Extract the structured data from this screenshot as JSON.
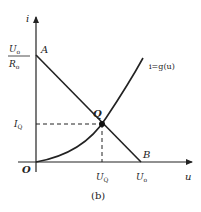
{
  "figure": {
    "caption": "(b)",
    "colors": {
      "ink": "#222222",
      "background": "#ffffff"
    }
  },
  "axes": {
    "y_label": "i",
    "x_label": "u",
    "origin_label": "O"
  },
  "points": {
    "A": {
      "label": "A"
    },
    "Q": {
      "label": "Q"
    },
    "B": {
      "label": "B"
    }
  },
  "y_ticks": {
    "intercept_numerator": "U",
    "intercept_numerator_sub": "o",
    "intercept_denominator": "R",
    "intercept_denominator_sub": "o",
    "iq_main": "I",
    "iq_sub": "Q"
  },
  "x_ticks": {
    "uq_main": "U",
    "uq_sub": "Q",
    "uo_main": "U",
    "uo_sub": "o"
  },
  "curves": {
    "nonlinear_label": "i=g(u)",
    "load_line": "A–B straight line"
  }
}
